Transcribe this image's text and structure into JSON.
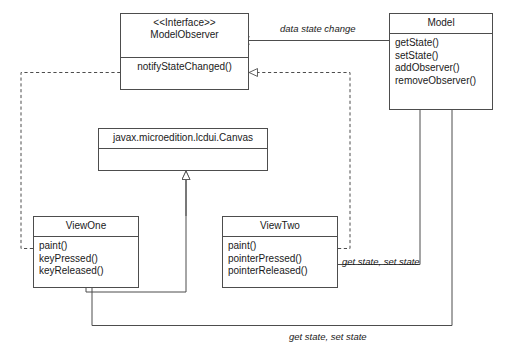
{
  "diagram": {
    "kind": "uml-class-diagram",
    "line_color": "#4d4d4d",
    "text_color": "#1a1a1a",
    "background": "#ffffff"
  },
  "classes": {
    "model_observer": {
      "stereotype": "<<Interface>>",
      "name": "ModelObserver",
      "members": [
        "notifyStateChanged()"
      ]
    },
    "model": {
      "stereotype": "",
      "name": "Model",
      "members": [
        "getState()",
        "setState()",
        "addObserver()",
        "removeObserver()"
      ]
    },
    "canvas": {
      "stereotype": "",
      "name": "javax.microedition.lcdui.Canvas",
      "members": []
    },
    "view_one": {
      "stereotype": "",
      "name": "ViewOne",
      "members": [
        "paint()",
        "keyPressed()",
        "keyReleased()"
      ]
    },
    "view_two": {
      "stereotype": "",
      "name": "ViewTwo",
      "members": [
        "paint()",
        "pointerPressed()",
        "pointerReleased()"
      ]
    }
  },
  "edge_labels": {
    "data_state_change": "data state change",
    "get_set_state_view_two": "get state, set state",
    "get_set_state_view_one": "get state, set state"
  }
}
